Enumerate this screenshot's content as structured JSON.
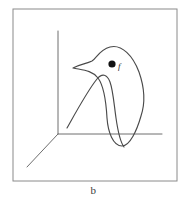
{
  "figure": {
    "caption": "b",
    "frame": {
      "x": 13,
      "y": 9,
      "width": 164,
      "height": 172,
      "stroke_color": "#8a8a8a"
    },
    "axes": {
      "origin": {
        "x": 58,
        "y": 134
      },
      "vertical_top": {
        "x": 58,
        "y": 31
      },
      "horizontal_right": {
        "x": 162,
        "y": 134
      },
      "depth_end": {
        "x": 27,
        "y": 167
      },
      "stroke_color": "#6e6e6e"
    },
    "marker": {
      "label": "f",
      "x": 112,
      "y": 64,
      "radius": 3.6,
      "color": "#111111",
      "label_x": 118,
      "label_y": 69
    },
    "curve": {
      "stroke_color": "#4a4a4a",
      "description": "closed teardrop loop with inner arc",
      "outer_loop": "M 73 68 C 80 64 86 64 92 61 C 97 58 99 50 110 47 C 122 44 133 56 139 72 C 145 89 145 104 141 116 C 137 130 130 146 122 146 C 113 146 108 132 107 118 C 106 100 104 86 98 78 C 92 70 82 70 73 68 Z",
      "inner_arc": "M 67 128 C 76 112 88 90 97 79 C 102 73 107 74 110 82 C 113 90 114 104 116 118 C 118 132 121 143 124 147"
    }
  }
}
